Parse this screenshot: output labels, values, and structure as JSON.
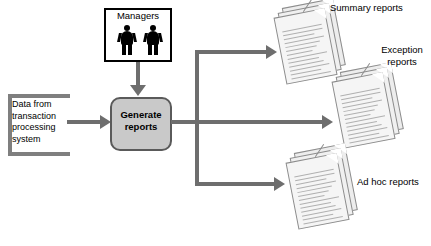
{
  "diagram": {
    "background_color": "#ffffff",
    "connector_color": "#6e6e6e",
    "process_fill_color": "#c9c9c9",
    "process_border_color": "#5a5a5a"
  },
  "source": {
    "label": "Data from transaction processing system",
    "shape": "open-bracket"
  },
  "managers": {
    "label": "Managers",
    "icon": "two-people-icon",
    "figure_count": 2
  },
  "process": {
    "label": "Generate reports"
  },
  "outputs": [
    {
      "id": "summary",
      "label": "Summary reports",
      "icon": "document-stack-icon",
      "page_count": 3
    },
    {
      "id": "exception",
      "label": "Exception reports",
      "icon": "document-stack-icon",
      "page_count": 3
    },
    {
      "id": "adhoc",
      "label": "Ad hoc reports",
      "icon": "document-stack-icon",
      "page_count": 3
    }
  ],
  "connectors": [
    {
      "id": "source-to-process",
      "direction": "right"
    },
    {
      "id": "managers-to-process",
      "direction": "down"
    },
    {
      "id": "process-to-summary",
      "direction": "right"
    },
    {
      "id": "process-to-exception",
      "direction": "right"
    },
    {
      "id": "process-to-adhoc",
      "direction": "right"
    }
  ]
}
